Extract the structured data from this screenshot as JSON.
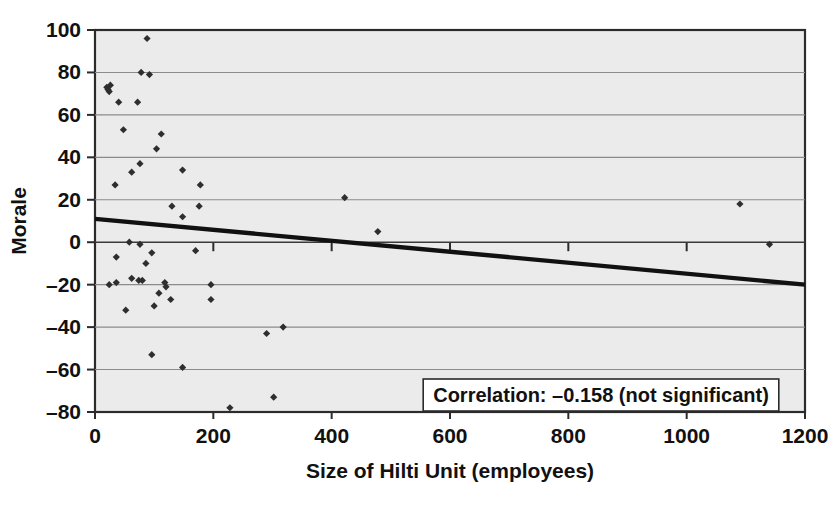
{
  "chart_data": {
    "type": "scatter",
    "title": "",
    "xlabel": "Size of Hilti Unit (employees)",
    "ylabel": "Morale",
    "xlim": [
      0,
      1200
    ],
    "ylim": [
      -80,
      100
    ],
    "xticks": [
      "0",
      "200",
      "400",
      "600",
      "800",
      "1000",
      "1200"
    ],
    "xtick_values": [
      0,
      200,
      400,
      600,
      800,
      1000,
      1200
    ],
    "yticks": [
      "100",
      "80",
      "60",
      "40",
      "20",
      "0",
      "-20",
      "-40",
      "-60",
      "-80"
    ],
    "ytick_values": [
      100,
      80,
      60,
      40,
      20,
      0,
      -20,
      -40,
      -60,
      -80
    ],
    "grid": true,
    "grid_axis": "y",
    "legend": "none",
    "annotation": "Correlation: –0.158 (not significant)",
    "correlation": -0.158,
    "significance": "not significant",
    "points": [
      [
        20,
        73
      ],
      [
        22,
        72
      ],
      [
        24,
        71
      ],
      [
        26,
        74
      ],
      [
        40,
        66
      ],
      [
        48,
        53
      ],
      [
        72,
        66
      ],
      [
        78,
        80
      ],
      [
        92,
        79
      ],
      [
        88,
        96
      ],
      [
        112,
        51
      ],
      [
        104,
        44
      ],
      [
        76,
        37
      ],
      [
        62,
        33
      ],
      [
        34,
        27
      ],
      [
        148,
        34
      ],
      [
        178,
        27
      ],
      [
        130,
        17
      ],
      [
        176,
        17
      ],
      [
        148,
        12
      ],
      [
        1090,
        18
      ],
      [
        422,
        21
      ],
      [
        478,
        5
      ],
      [
        58,
        0
      ],
      [
        76,
        -1
      ],
      [
        96,
        -5
      ],
      [
        170,
        -4
      ],
      [
        36,
        -7
      ],
      [
        86,
        -10
      ],
      [
        62,
        -17
      ],
      [
        74,
        -18
      ],
      [
        80,
        -18
      ],
      [
        24,
        -20
      ],
      [
        36,
        -19
      ],
      [
        118,
        -19
      ],
      [
        120,
        -21
      ],
      [
        108,
        -24
      ],
      [
        196,
        -20
      ],
      [
        128,
        -27
      ],
      [
        196,
        -27
      ],
      [
        100,
        -30
      ],
      [
        52,
        -32
      ],
      [
        290,
        -43
      ],
      [
        318,
        -40
      ],
      [
        96,
        -53
      ],
      [
        148,
        -59
      ],
      [
        228,
        -78
      ],
      [
        302,
        -73
      ],
      [
        1140,
        -1
      ]
    ],
    "trendline": {
      "type": "linear",
      "x_start": 0,
      "y_start": 11,
      "x_end": 1200,
      "y_end": -20
    },
    "colors": {
      "plot_background": "#ebebeb",
      "figure_background": "#ffffff",
      "point": "#2e2e2e",
      "trendline": "#111111",
      "gridline": "#8b8b8b",
      "frame": "#2b2b2b"
    }
  }
}
